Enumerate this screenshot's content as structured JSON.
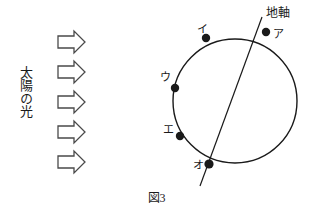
{
  "figure": {
    "caption": "図3",
    "background_color": "#ffffff",
    "ink_color": "#1a1a1a"
  },
  "sunlight": {
    "label": "太陽の光",
    "arrow_icon_name": "right-arrow-icon",
    "arrow_count": 5,
    "arrow_direction": "right",
    "arrows": [
      {
        "id": "arrow-1",
        "x": 58,
        "y": 31
      },
      {
        "id": "arrow-2",
        "x": 58,
        "y": 61
      },
      {
        "id": "arrow-3",
        "x": 58,
        "y": 91
      },
      {
        "id": "arrow-4",
        "x": 58,
        "y": 121
      },
      {
        "id": "arrow-5",
        "x": 58,
        "y": 151
      }
    ]
  },
  "earth": {
    "circle": {
      "cx": 235,
      "cy": 101,
      "r": 62
    },
    "axis": {
      "label": "地軸",
      "x1": 262,
      "y1": 17,
      "x2": 200,
      "y2": 186
    },
    "points": [
      {
        "key": "a",
        "label": "ア",
        "cx": 266,
        "cy": 32
      },
      {
        "key": "i",
        "label": "イ",
        "cx": 206,
        "cy": 38
      },
      {
        "key": "u",
        "label": "ウ",
        "cx": 175,
        "cy": 88
      },
      {
        "key": "e",
        "label": "エ",
        "cx": 180,
        "cy": 136
      },
      {
        "key": "o",
        "label": "オ",
        "cx": 209,
        "cy": 164
      }
    ]
  }
}
